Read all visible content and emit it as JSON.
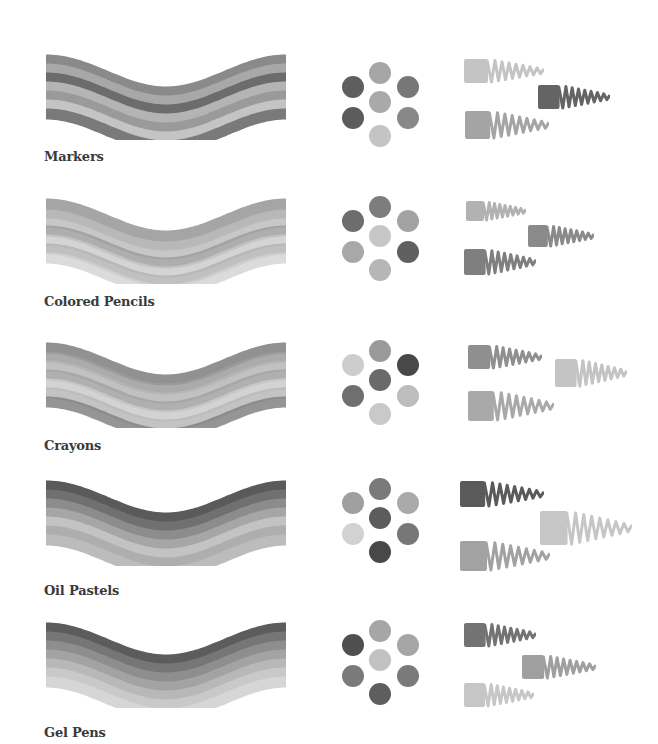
{
  "sections": [
    {
      "label": "Markers",
      "top": 48,
      "label_top": 149,
      "wave_bands": [
        "#8a8a8a",
        "#a8a8a8",
        "#6c6c6c",
        "#b4b4b4",
        "#9a9a9a",
        "#c4c4c4",
        "#7a7a7a"
      ],
      "texture": "smooth",
      "dots": [
        "#a6a6a6",
        "#5e5e5e",
        "#777777",
        "#a9a9a9",
        "#5c5c5c",
        "#888888",
        "#c4c4c4"
      ],
      "scribbles": [
        {
          "color": "#c4c4c4",
          "x": 4,
          "y": 6,
          "w": 80,
          "h": 26
        },
        {
          "color": "#646464",
          "x": 78,
          "y": 32,
          "w": 72,
          "h": 26
        },
        {
          "color": "#a4a4a4",
          "x": 5,
          "y": 58,
          "w": 84,
          "h": 30
        }
      ]
    },
    {
      "label": "Colored Pencils",
      "top": 192,
      "label_top": 294,
      "wave_bands": [
        "#8e8e8e",
        "#a6a6a6",
        "#b9b9b9",
        "#9a9a9a",
        "#c9c9c9",
        "#b0b0b0",
        "#d2d2d2"
      ],
      "texture": "pencil",
      "dots": [
        "#7d7d7d",
        "#6d6d6d",
        "#a3a3a3",
        "#c6c6c6",
        "#a8a8a8",
        "#5f5f5f",
        "#b6b6b6"
      ],
      "scribbles": [
        {
          "color": "#b2b2b2",
          "x": 6,
          "y": 8,
          "w": 60,
          "h": 22
        },
        {
          "color": "#8a8a8a",
          "x": 68,
          "y": 32,
          "w": 66,
          "h": 24
        },
        {
          "color": "#7f7f7f",
          "x": 4,
          "y": 56,
          "w": 72,
          "h": 28
        }
      ]
    },
    {
      "label": "Crayons",
      "top": 336,
      "label_top": 438,
      "wave_bands": [
        "#7e7e7e",
        "#9c9c9c",
        "#b6b6b6",
        "#a2a2a2",
        "#cbcbcb",
        "#b9b9b9",
        "#828282"
      ],
      "texture": "crayon",
      "dots": [
        "#9a9a9a",
        "#cdcdcd",
        "#484848",
        "#6a6a6a",
        "#6f6f6f",
        "#bdbdbd",
        "#c9c9c9"
      ],
      "scribbles": [
        {
          "color": "#8f8f8f",
          "x": 8,
          "y": 8,
          "w": 74,
          "h": 26
        },
        {
          "color": "#c3c3c3",
          "x": 95,
          "y": 22,
          "w": 72,
          "h": 30
        },
        {
          "color": "#a9a9a9",
          "x": 8,
          "y": 54,
          "w": 86,
          "h": 32
        }
      ]
    },
    {
      "label": "Oil Pastels",
      "top": 474,
      "label_top": 583,
      "wave_bands": [
        "#5a5a5a",
        "#707070",
        "#8c8c8c",
        "#a6a6a6",
        "#c3c3c3",
        "#aeaeae",
        "#bcbcbc"
      ],
      "texture": "pastel",
      "dots": [
        "#7a7a7a",
        "#9f9f9f",
        "#aaaaaa",
        "#5c5c5c",
        "#d2d2d2",
        "#777777",
        "#484848"
      ],
      "scribbles": [
        {
          "color": "#5a5a5a",
          "x": 0,
          "y": 6,
          "w": 84,
          "h": 28
        },
        {
          "color": "#c6c6c6",
          "x": 80,
          "y": 36,
          "w": 92,
          "h": 36
        },
        {
          "color": "#a2a2a2",
          "x": 0,
          "y": 66,
          "w": 90,
          "h": 32
        }
      ]
    },
    {
      "label": "Gel Pens",
      "top": 616,
      "label_top": 725,
      "wave_bands": [
        "#5c5c5c",
        "#767676",
        "#8e8e8e",
        "#a3a3a3",
        "#b8b8b8",
        "#c9c9c9",
        "#d6d6d6"
      ],
      "texture": "smooth",
      "dots": [
        "#a6a6a6",
        "#4f4f4f",
        "#a6a6a6",
        "#c2c2c2",
        "#7a7a7a",
        "#7a7a7a",
        "#5e5e5e"
      ],
      "scribbles": [
        {
          "color": "#737373",
          "x": 4,
          "y": 6,
          "w": 72,
          "h": 26
        },
        {
          "color": "#9f9f9f",
          "x": 62,
          "y": 38,
          "w": 74,
          "h": 26
        },
        {
          "color": "#c6c6c6",
          "x": 4,
          "y": 66,
          "w": 70,
          "h": 26
        }
      ]
    }
  ]
}
